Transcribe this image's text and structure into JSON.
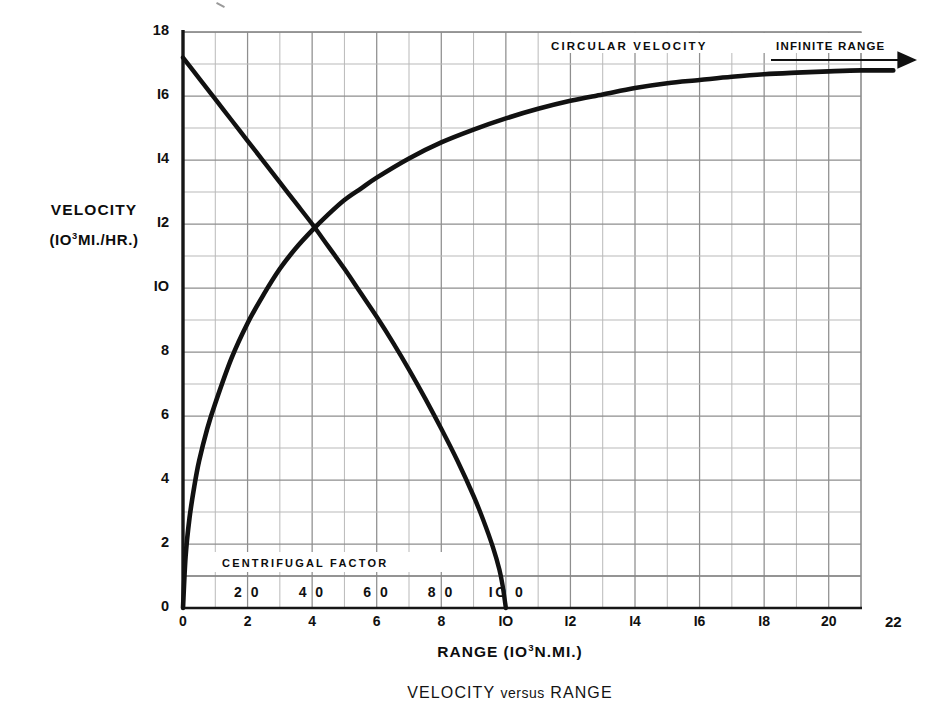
{
  "figure": {
    "caption": "VELOCITY versus RANGE",
    "caption_versus": "versus",
    "caption_left": "VELOCITY",
    "caption_right": "RANGE"
  },
  "axes": {
    "y_label_line1": "VELOCITY",
    "y_label_line2_pre": "(IO",
    "y_label_line2_sup": "3",
    "y_label_line2_post": "MI./HR.)",
    "x_label_pre": "RANGE (IO",
    "x_label_sup": "3",
    "x_label_post": "N.MI.)",
    "y_ticks": [
      "0",
      "2",
      "4",
      "6",
      "8",
      "IO",
      "I2",
      "I4",
      "I6",
      "18"
    ],
    "y_tick_values": [
      0,
      2,
      4,
      6,
      8,
      10,
      12,
      14,
      16,
      18
    ],
    "x_ticks": [
      "0",
      "2",
      "4",
      "6",
      "8",
      "IO",
      "I2",
      "I4",
      "I6",
      "I8",
      "20",
      "22"
    ],
    "x_tick_values": [
      0,
      2,
      4,
      6,
      8,
      10,
      12,
      14,
      16,
      18,
      20,
      22
    ],
    "secondary_x_ticks": [
      "2 0",
      "4 0",
      "6 0",
      "8 0",
      "IO 0"
    ],
    "secondary_x_tick_values": [
      20,
      40,
      60,
      80,
      100
    ]
  },
  "annotations": {
    "circular_velocity": "CIRCULAR VELOCITY",
    "infinite_range": "INFINITE RANGE",
    "centrifugal_factor": "CENTRIFUGAL FACTOR"
  },
  "colors": {
    "curve": "#111111",
    "grid_major": "#8e8e8e",
    "grid_minor": "#b9b9b9",
    "axis": "#1a1a1a",
    "text": "#111111",
    "background": "#ffffff"
  },
  "chart_data": {
    "type": "line",
    "title": "VELOCITY versus RANGE",
    "xlabel": "RANGE (10^3 N.MI.)",
    "ylabel": "VELOCITY (10^3 MI./HR.)",
    "xlim": [
      0,
      21
    ],
    "ylim": [
      0,
      18
    ],
    "grid": true,
    "grid_spacing_x": 1,
    "grid_spacing_y": 1,
    "legend": "none",
    "secondary_xlabel": "CENTRIFUGAL FACTOR",
    "secondary_xlim": [
      0,
      210
    ],
    "annotations": [
      {
        "text": "CIRCULAR VELOCITY",
        "x": 11.5,
        "y": 17.7
      },
      {
        "text": "INFINITE RANGE",
        "x": 18.6,
        "y": 17.7,
        "arrow": "right"
      },
      {
        "text": "CENTRIFUGAL FACTOR",
        "x": 2.1,
        "y": 1.65
      }
    ],
    "series": [
      {
        "name": "Escape / ascending velocity (approaches infinite range asymptote)",
        "asymptote": 16.8,
        "x": [
          0,
          0.08,
          0.2,
          0.35,
          0.5,
          0.75,
          1.0,
          1.5,
          2.0,
          2.5,
          3.0,
          3.5,
          4.0,
          4.5,
          5.0,
          5.5,
          6.0,
          7.0,
          8.0,
          9.0,
          10.0,
          11.0,
          12.0,
          13.0,
          14.0,
          15.0,
          16.0,
          17.0,
          18.0,
          19.0,
          20.0,
          21.0,
          22.0
        ],
        "y": [
          0,
          1.6,
          2.8,
          3.8,
          4.6,
          5.6,
          6.4,
          7.8,
          8.9,
          9.8,
          10.6,
          11.25,
          11.8,
          12.3,
          12.75,
          13.1,
          13.45,
          14.05,
          14.55,
          14.95,
          15.3,
          15.6,
          15.85,
          16.05,
          16.25,
          16.4,
          16.5,
          16.6,
          16.68,
          16.73,
          16.77,
          16.8,
          16.8
        ]
      },
      {
        "name": "Centrifugal-limited descending velocity",
        "x": [
          0,
          0.5,
          1.0,
          1.5,
          2.0,
          2.5,
          3.0,
          3.5,
          4.0,
          4.5,
          5.0,
          5.5,
          6.0,
          6.5,
          7.0,
          7.5,
          8.0,
          8.5,
          9.0,
          9.3,
          9.6,
          9.8,
          9.9,
          10.0
        ],
        "y": [
          17.2,
          16.55,
          15.9,
          15.25,
          14.6,
          13.95,
          13.3,
          12.65,
          12.0,
          11.3,
          10.6,
          9.85,
          9.1,
          8.3,
          7.45,
          6.55,
          5.6,
          4.6,
          3.5,
          2.75,
          1.9,
          1.2,
          0.7,
          0.0
        ]
      }
    ],
    "intersection": {
      "x": 5.0,
      "y": 12.0
    }
  }
}
